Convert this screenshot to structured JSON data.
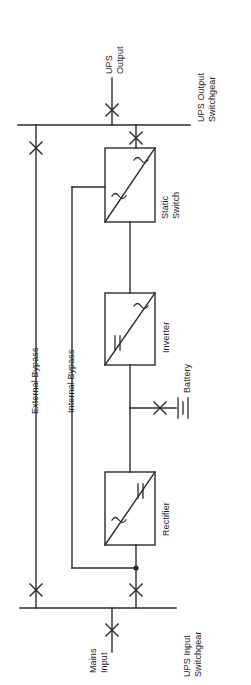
{
  "diagram": {
    "type": "single-line-electrical-schematic",
    "stroke_color": "#2b2b2b",
    "background_color": "#ffffff",
    "text_color": "#1d1d1d"
  },
  "labels": {
    "ups_output": "UPS\nOutput",
    "ups_output_switchgear": "UPS Output\nSwitchgear",
    "static_switch": "Static\nSwitch",
    "external_bypass": "External Bypass",
    "internal_bypass": "Internal Bypass",
    "inverter": "Inverter",
    "battery": "Battery",
    "rectifier": "Rectifier",
    "mains_input": "Mains\nInput",
    "ups_input_switchgear": "UPS Input\nSwitchgear"
  },
  "blocks": [
    {
      "id": "static-switch",
      "name": "Static Switch",
      "label": "Static\nSwitch",
      "input_symbol": "~",
      "output_symbol": "~",
      "conversion": "AC/AC",
      "x": 105,
      "y": 148,
      "width": 50,
      "height": 74
    },
    {
      "id": "inverter",
      "name": "Inverter",
      "label": "Inverter",
      "input_symbol": "=",
      "output_symbol": "~",
      "conversion": "DC/AC",
      "x": 105,
      "y": 293,
      "width": 50,
      "height": 72
    },
    {
      "id": "rectifier",
      "name": "Rectifier",
      "label": "Rectifier",
      "input_symbol": "~",
      "output_symbol": "=",
      "conversion": "AC/DC",
      "x": 105,
      "y": 472,
      "width": 50,
      "height": 73
    }
  ],
  "buses": [
    {
      "id": "ups-output-switchgear",
      "label": "UPS Output\nSwitchgear",
      "y": 125,
      "x1": 18,
      "x2": 190
    },
    {
      "id": "ups-input-switchgear",
      "label": "UPS Input\nSwitchgear",
      "y": 608,
      "x1": 20,
      "x2": 176
    }
  ],
  "switches": [
    {
      "id": "ups-output-disconnect",
      "name": "UPS Output Disconnect",
      "x": 112,
      "y": 110
    },
    {
      "id": "static-switch-output-disconnect",
      "name": "Static Switch Output Disconnect",
      "x": 136,
      "y": 138
    },
    {
      "id": "external-bypass-output-disconnect",
      "name": "External Bypass Output Disconnect",
      "x": 36,
      "y": 148
    },
    {
      "id": "battery-disconnect",
      "name": "Battery Disconnect",
      "x": 160,
      "y": 408
    },
    {
      "id": "rectifier-input-disconnect",
      "name": "Rectifier Input Disconnect",
      "x": 136,
      "y": 590
    },
    {
      "id": "external-bypass-input-disconnect",
      "name": "External Bypass Input Disconnect",
      "x": 36,
      "y": 590
    },
    {
      "id": "mains-input-disconnect",
      "name": "Mains Input Disconnect",
      "x": 112,
      "y": 630
    }
  ],
  "battery": {
    "id": "battery-bank",
    "label": "Battery",
    "cell_count": 3,
    "x": 182,
    "y": 408
  },
  "junctions": [
    {
      "id": "internal-bypass-tap",
      "x": 136,
      "y": 568
    },
    {
      "id": "battery-tap",
      "x": 130,
      "y": 408
    }
  ]
}
